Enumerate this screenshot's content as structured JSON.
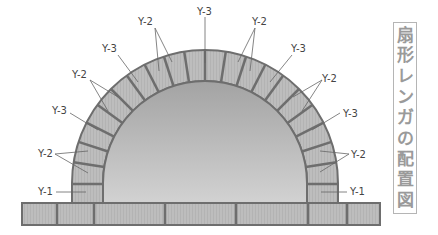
{
  "title": {
    "text": "扇形レンガの配置図",
    "chars": [
      "扇",
      "形",
      "レ",
      "ン",
      "ガ",
      "の",
      "配",
      "置",
      "図"
    ]
  },
  "labels": {
    "left": [
      {
        "id": "l-y1",
        "text": "Y-1"
      },
      {
        "id": "l-y2a",
        "text": "Y-2"
      },
      {
        "id": "l-y3a",
        "text": "Y-3"
      },
      {
        "id": "l-y2b",
        "text": "Y-2"
      },
      {
        "id": "l-y3b",
        "text": "Y-3"
      },
      {
        "id": "l-y2c",
        "text": "Y-2"
      }
    ],
    "top": {
      "id": "t-y3",
      "text": "Y-3"
    },
    "right": [
      {
        "id": "r-y2c",
        "text": "Y-2"
      },
      {
        "id": "r-y3b",
        "text": "Y-3"
      },
      {
        "id": "r-y2b",
        "text": "Y-2"
      },
      {
        "id": "r-y3a",
        "text": "Y-3"
      },
      {
        "id": "r-y2a",
        "text": "Y-2"
      },
      {
        "id": "r-y1",
        "text": "Y-1"
      }
    ]
  },
  "colors": {
    "brick_fill": "#b9b9b9",
    "mortar": "#6e6e6e",
    "interior_light": "#cfcfcf",
    "interior_dark": "#9c9c9c",
    "leader_line": "#666666",
    "title_text": "#9a9a9a",
    "title_border": "#b5b5b5"
  }
}
